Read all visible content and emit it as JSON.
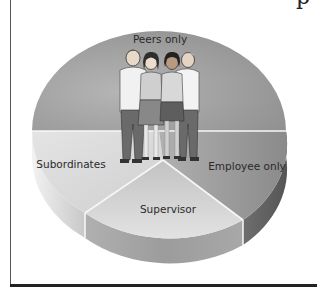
{
  "figure": {
    "type": "360-degree feedback pie diagram",
    "header_fragment": "p",
    "segments": [
      {
        "id": "peers-only",
        "label": "Peers only",
        "shade": "#9a9a9a"
      },
      {
        "id": "subordinates",
        "label": "Subordinates",
        "shade": "#dcdcdc"
      },
      {
        "id": "supervisor",
        "label": "Supervisor",
        "shade": "#cfcfcf"
      },
      {
        "id": "employee-only",
        "label": "Employee only",
        "shade": "#8c8c8c"
      }
    ],
    "illustration": "group of four people standing together"
  }
}
